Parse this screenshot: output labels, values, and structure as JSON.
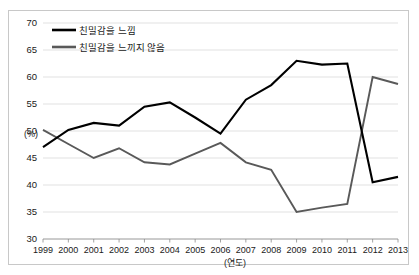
{
  "chart_data": {
    "type": "line",
    "title": "",
    "subtitle": "",
    "xlabel": "(연도)",
    "ylabel": "(%)",
    "ylim": [
      30,
      70
    ],
    "yticks": [
      30,
      35,
      40,
      45,
      50,
      55,
      60,
      65,
      70
    ],
    "grid": true,
    "legend_position": "top-left",
    "categories": [
      "1999",
      "2000",
      "2001",
      "2002",
      "2003",
      "2004",
      "2005",
      "2006",
      "2007",
      "2008",
      "2009",
      "2010",
      "2011",
      "2012",
      "2013"
    ],
    "series": [
      {
        "name": "친밀감을 느낌",
        "color": "#000000",
        "values": [
          47.0,
          50.2,
          51.5,
          51.0,
          54.5,
          55.3,
          52.5,
          49.5,
          55.8,
          58.5,
          63.0,
          62.3,
          62.5,
          40.5,
          41.5
        ]
      },
      {
        "name": "친밀감을 느끼지 않음",
        "color": "#595959",
        "values": [
          50.2,
          47.6,
          45.0,
          46.8,
          44.2,
          43.8,
          45.8,
          47.8,
          44.2,
          42.8,
          35.0,
          35.8,
          36.5,
          60.0,
          58.7
        ]
      }
    ]
  },
  "legend": {
    "items": [
      {
        "label": "친밀감을 느낌"
      },
      {
        "label": "친밀감을 느끼지 않음"
      }
    ]
  },
  "axes": {
    "y_unit_label": "(%)",
    "x_caption": "(연도)"
  },
  "colors": {
    "series_a": "#000000",
    "series_b": "#595959",
    "gridline": "#d9d9d9",
    "axis": "#8c8c8c",
    "frame": "#c8c8c8",
    "background": "#ffffff",
    "text": "#1a1a1a"
  }
}
